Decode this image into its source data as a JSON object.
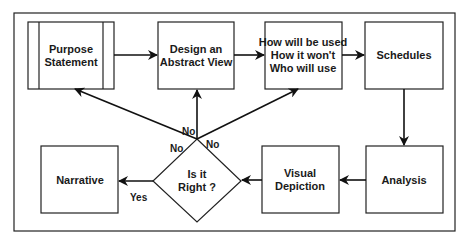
{
  "diagram": {
    "type": "flowchart",
    "nodes": {
      "purpose": {
        "line1": "Purpose",
        "line2": "Statement",
        "shape": "predefined-process"
      },
      "design": {
        "line1": "Design an",
        "line2": "Abstract View",
        "shape": "process"
      },
      "how": {
        "line1": "How will be used",
        "line2": "How it won't",
        "line3": "Who will use",
        "shape": "process"
      },
      "schedules": {
        "line1": "Schedules",
        "shape": "process"
      },
      "analysis": {
        "line1": "Analysis",
        "shape": "process"
      },
      "visual": {
        "line1": "Visual",
        "line2": "Depiction",
        "shape": "process"
      },
      "decision": {
        "line1": "Is it",
        "line2": "Right ?",
        "shape": "decision"
      },
      "narrative": {
        "line1": "Narrative",
        "shape": "process"
      }
    },
    "edges": [
      {
        "from": "Purpose Statement",
        "to": "Design an Abstract View",
        "label": ""
      },
      {
        "from": "Design an Abstract View",
        "to": "How will be used / How it won't / Who will use",
        "label": ""
      },
      {
        "from": "How will be used / How it won't / Who will use",
        "to": "Schedules",
        "label": ""
      },
      {
        "from": "Schedules",
        "to": "Analysis",
        "label": ""
      },
      {
        "from": "Analysis",
        "to": "Visual Depiction",
        "label": ""
      },
      {
        "from": "Visual Depiction",
        "to": "Is it Right ?",
        "label": ""
      },
      {
        "from": "Is it Right ?",
        "to": "Narrative",
        "label": "Yes"
      },
      {
        "from": "Is it Right ?",
        "to": "Purpose Statement",
        "label": "No"
      },
      {
        "from": "Is it Right ?",
        "to": "Design an Abstract View",
        "label": "No"
      },
      {
        "from": "Is it Right ?",
        "to": "How will be used / How it won't / Who will use",
        "label": "No"
      }
    ],
    "edge_labels": {
      "yes": "Yes",
      "no_left": "No",
      "no_up": "No",
      "no_right": "No"
    }
  }
}
